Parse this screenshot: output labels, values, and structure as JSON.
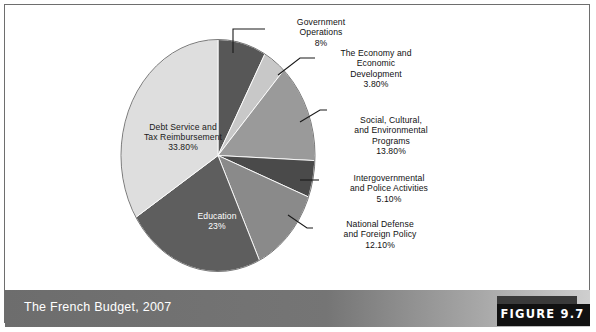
{
  "figure": {
    "caption": "The French Budget, 2007",
    "figure_number_label": "FIGURE 9.7",
    "frame_border_color": "#6e6e6e",
    "caption_bar_color": "#6d6d6d",
    "caption_text_color": "#ffffff",
    "figure_tab_color": "#111111"
  },
  "chart_data": {
    "type": "pie",
    "title": "The French Budget, 2007",
    "xlabel": "",
    "ylabel": "",
    "grid": false,
    "legend_position": "callout-labels",
    "start_angle_deg": -90,
    "direction": "clockwise",
    "categories": [
      "Government Operations",
      "The Economy and Economic Development",
      "Social, Cultural, and Environmental Programs",
      "Intergovernmental and Police Activities",
      "National Defense and Foreign Policy",
      "Education",
      "Debt Service and Tax Reimbursement"
    ],
    "values": [
      8,
      3.8,
      13.8,
      5.1,
      12.1,
      23,
      33.8
    ],
    "value_labels": [
      "8%",
      "3.80%",
      "13.80%",
      "5.10%",
      "12.10%",
      "23%",
      "33.80%"
    ],
    "colors": [
      "#575757",
      "#c8c8c8",
      "#9a9a9a",
      "#4a4a4a",
      "#8a8a8a",
      "#5e5e5e",
      "#dedede"
    ],
    "slices": [
      {
        "name": "Government Operations",
        "value": 8,
        "value_label": "8%",
        "color": "#575757",
        "label_lines": [
          "Government",
          "Operations",
          "8%"
        ],
        "label_placement": "callout"
      },
      {
        "name": "The Economy and Economic Development",
        "value": 3.8,
        "value_label": "3.80%",
        "color": "#c8c8c8",
        "label_lines": [
          "The Economy and",
          "Economic",
          "Development",
          "3.80%"
        ],
        "label_placement": "callout"
      },
      {
        "name": "Social, Cultural, and Environmental Programs",
        "value": 13.8,
        "value_label": "13.80%",
        "color": "#9a9a9a",
        "label_lines": [
          "Social, Cultural,",
          "and Environmental",
          "Programs",
          "13.80%"
        ],
        "label_placement": "callout"
      },
      {
        "name": "Intergovernmental and Police Activities",
        "value": 5.1,
        "value_label": "5.10%",
        "color": "#4a4a4a",
        "label_lines": [
          "Intergovernmental",
          "and Police Activities",
          "5.10%"
        ],
        "label_placement": "callout"
      },
      {
        "name": "National Defense and Foreign Policy",
        "value": 12.1,
        "value_label": "12.10%",
        "color": "#8a8a8a",
        "label_lines": [
          "National Defense",
          "and Foreign Policy",
          "12.10%"
        ],
        "label_placement": "callout"
      },
      {
        "name": "Education",
        "value": 23,
        "value_label": "23%",
        "color": "#5e5e5e",
        "label_lines": [
          "Education",
          "23%"
        ],
        "label_placement": "inside"
      },
      {
        "name": "Debt Service and Tax Reimbursement",
        "value": 33.8,
        "value_label": "33.80%",
        "color": "#dedede",
        "label_lines": [
          "Debt Service and",
          "Tax Reimbursement",
          "33.80%"
        ],
        "label_placement": "inside"
      }
    ]
  },
  "labels": {
    "debt_service": {
      "line1": "Debt Service and",
      "line2": "Tax Reimbursement",
      "pct": "33.80%"
    },
    "education": {
      "line1": "Education",
      "pct": "23%"
    },
    "government_operations": {
      "line1": "Government",
      "line2": "Operations",
      "pct": "8%"
    },
    "economy": {
      "line1": "The Economy and",
      "line2": "Economic",
      "line3": "Development",
      "pct": "3.80%"
    },
    "social": {
      "line1": "Social, Cultural,",
      "line2": "and Environmental",
      "line3": "Programs",
      "pct": "13.80%"
    },
    "intergovernmental": {
      "line1": "Intergovernmental",
      "line2": "and Police Activities",
      "pct": "5.10%"
    },
    "defense": {
      "line1": "National Defense",
      "line2": "and Foreign Policy",
      "pct": "12.10%"
    }
  }
}
